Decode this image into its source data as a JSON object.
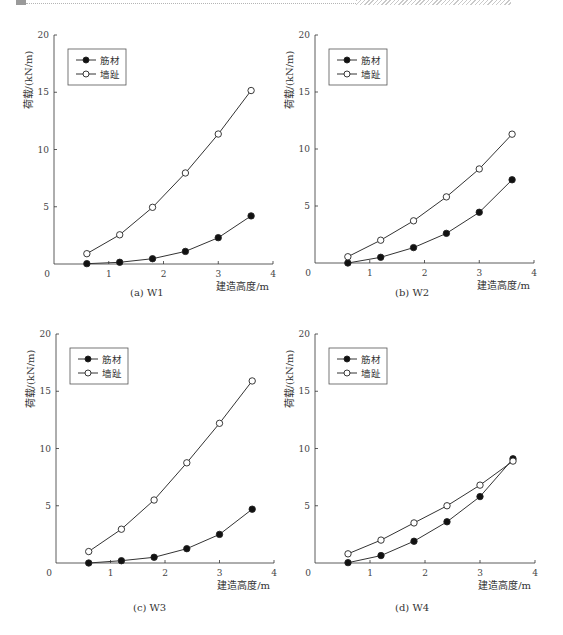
{
  "page": {
    "header_decoration": "top-rule"
  },
  "captions": [
    "(a) W1",
    "(b) W2",
    "(c) W3",
    "(d) W4"
  ],
  "chart_data": [
    {
      "type": "line",
      "id": "W1",
      "caption": "(a) W1",
      "xlabel": "建造高度/m",
      "ylabel": "荷载/(kN/m)",
      "xlim": [
        0,
        4
      ],
      "ylim": [
        0,
        20
      ],
      "xticks": [
        0,
        1,
        2,
        3,
        4
      ],
      "yticks": [
        0,
        5,
        10,
        15,
        20
      ],
      "grid": false,
      "legend_position": "upper-left",
      "x": [
        0.6,
        1.2,
        1.8,
        2.4,
        3.0,
        3.6
      ],
      "series": [
        {
          "name": "筋材",
          "marker": "filled-circle",
          "values": [
            0.03,
            0.15,
            0.46,
            1.1,
            2.3,
            4.2
          ]
        },
        {
          "name": "墙趾",
          "marker": "open-circle",
          "values": [
            0.9,
            2.55,
            4.95,
            7.95,
            11.35,
            15.15
          ]
        }
      ]
    },
    {
      "type": "line",
      "id": "W2",
      "caption": "(b) W2",
      "xlabel": "建造高度/m",
      "ylabel": "荷载/(kN/m)",
      "xlim": [
        0,
        4
      ],
      "ylim": [
        0,
        20
      ],
      "xticks": [
        0,
        1,
        2,
        3,
        4
      ],
      "yticks": [
        0,
        5,
        10,
        15,
        20
      ],
      "grid": false,
      "legend_position": "upper-left",
      "x": [
        0.6,
        1.2,
        1.8,
        2.4,
        3.0,
        3.6
      ],
      "series": [
        {
          "name": "筋材",
          "marker": "filled-circle",
          "values": [
            0.0,
            0.5,
            1.35,
            2.6,
            4.45,
            7.3
          ]
        },
        {
          "name": "墙趾",
          "marker": "open-circle",
          "values": [
            0.55,
            2.0,
            3.7,
            5.8,
            8.25,
            11.3
          ]
        }
      ]
    },
    {
      "type": "line",
      "id": "W3",
      "caption": "(c) W3",
      "xlabel": "建造高度/m",
      "ylabel": "荷载/(kN/m)",
      "xlim": [
        0,
        4
      ],
      "ylim": [
        0,
        20
      ],
      "xticks": [
        0,
        1,
        2,
        3,
        4
      ],
      "yticks": [
        0,
        5,
        10,
        15,
        20
      ],
      "grid": false,
      "legend_position": "upper-left",
      "x": [
        0.6,
        1.2,
        1.8,
        2.4,
        3.0,
        3.6
      ],
      "series": [
        {
          "name": "筋材",
          "marker": "filled-circle",
          "values": [
            0.0,
            0.2,
            0.5,
            1.25,
            2.5,
            4.7
          ]
        },
        {
          "name": "墙趾",
          "marker": "open-circle",
          "values": [
            1.0,
            2.95,
            5.5,
            8.75,
            12.2,
            15.9
          ]
        }
      ]
    },
    {
      "type": "line",
      "id": "W4",
      "caption": "(d) W4",
      "xlabel": "建造高度/m",
      "ylabel": "荷载/(kN/m)",
      "xlim": [
        0,
        4
      ],
      "ylim": [
        0,
        20
      ],
      "xticks": [
        0,
        1,
        2,
        3,
        4
      ],
      "yticks": [
        0,
        5,
        10,
        15,
        20
      ],
      "grid": false,
      "legend_position": "upper-left",
      "x": [
        0.6,
        1.2,
        1.8,
        2.4,
        3.0,
        3.6
      ],
      "series": [
        {
          "name": "筋材",
          "marker": "filled-circle",
          "values": [
            0.03,
            0.65,
            1.9,
            3.6,
            5.8,
            9.1
          ]
        },
        {
          "name": "墙趾",
          "marker": "open-circle",
          "values": [
            0.8,
            2.0,
            3.5,
            5.0,
            6.8,
            8.9
          ]
        }
      ]
    }
  ]
}
